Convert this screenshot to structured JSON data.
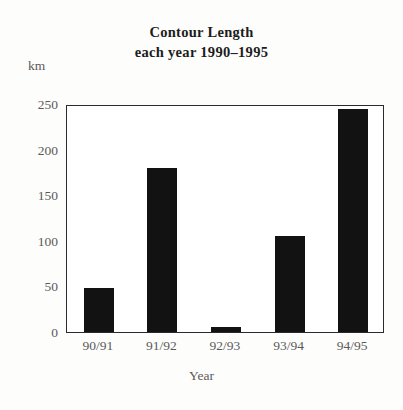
{
  "chart_data": {
    "type": "bar",
    "title_line_1": "Contour Length",
    "title_line_2": "each year 1990–1995",
    "categories": [
      "90/91",
      "91/92",
      "92/93",
      "93/94",
      "94/95"
    ],
    "values": [
      48,
      180,
      6,
      105,
      245
    ],
    "xlabel": "Year",
    "ylabel": "km",
    "ylim": [
      0,
      250
    ],
    "ytick_labels": [
      "250",
      "200",
      "150",
      "100",
      "50",
      "0"
    ],
    "ytick_values": [
      250,
      200,
      150,
      100,
      50,
      0
    ],
    "grid": false,
    "legend": "none",
    "bar_color": "#121212",
    "frame_color": "#2b2b2b",
    "background_color": "#ffffff",
    "text_color": "#5a5a5a"
  }
}
